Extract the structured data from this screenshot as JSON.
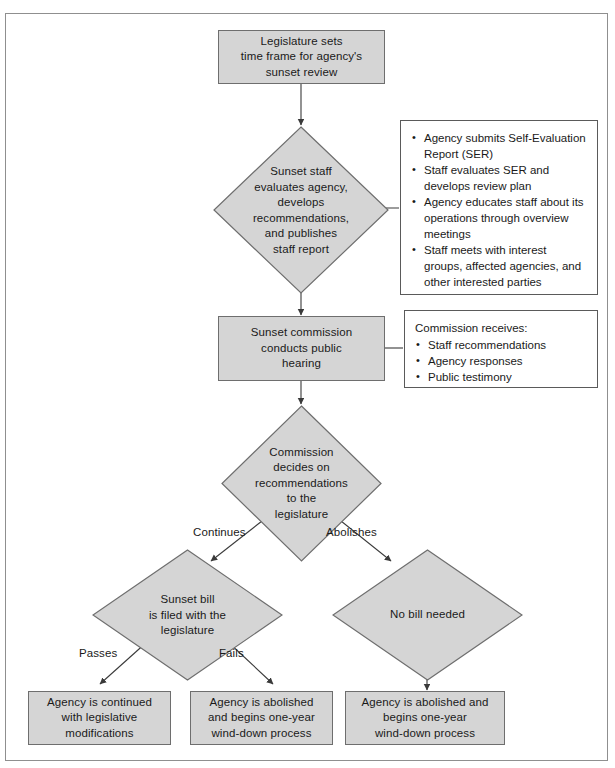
{
  "diagram": {
    "fill_color": "#d5d5d5",
    "stroke_color": "#6e6e6e",
    "text_color": "#1a1a1a"
  },
  "nodes": {
    "legislature_sets": "Legislature sets\ntime frame for agency's\nsunset review",
    "sunset_staff": "Sunset staff\nevaluates agency,\ndevelops\nrecommendations,\nand publishes\nstaff report",
    "public_hearing": "Sunset commission\nconducts public\nhearing",
    "commission_decides": "Commission\ndecides on\nrecommendations\nto the\nlegislature",
    "sunset_bill": "Sunset bill\nis filed with the\nlegislature",
    "no_bill": "No bill needed",
    "agency_continued": "Agency is continued\nwith legislative\nmodifications",
    "agency_abolished_mid": "Agency is abolished\nand begins one-year\nwind-down process",
    "agency_abolished_right": "Agency is abolished and\nbegins one-year\nwind-down process"
  },
  "panels": {
    "staff_activities": {
      "items": [
        "Agency submits Self-Evaluation Report (SER)",
        "Staff evaluates SER and develops review plan",
        "Agency educates staff about its operations through overview meetings",
        "Staff meets with interest groups, affected agencies, and other interested parties"
      ]
    },
    "commission_receives": {
      "heading": "Commission receives:",
      "items": [
        "Staff recommendations",
        "Agency responses",
        "Public testimony"
      ]
    }
  },
  "edge_labels": {
    "continues": "Continues",
    "abolishes": "Abolishes",
    "passes": "Passes",
    "fails": "Fails"
  }
}
